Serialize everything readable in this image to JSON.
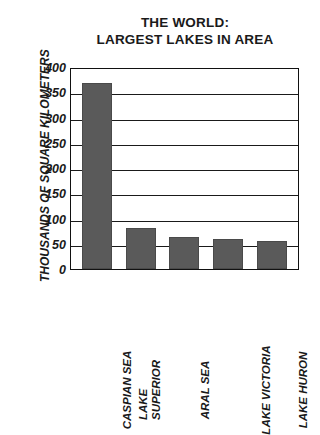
{
  "chart_data": {
    "type": "bar",
    "title": "THE WORLD: LARGEST LAKES IN AREA",
    "title_lines": [
      "THE WORLD:",
      "LARGEST LAKES IN AREA"
    ],
    "xlabel": "",
    "ylabel": "THOUSANDS OF SQUARE KILOMETERS",
    "ylim": [
      0,
      400
    ],
    "ytick_step": 50,
    "yticks": [
      400,
      350,
      300,
      250,
      200,
      150,
      100,
      50,
      0
    ],
    "ytick_labels": [
      "400",
      "350",
      "300",
      "250",
      "200",
      "150",
      "100",
      "50",
      "0"
    ],
    "grid": true,
    "grid_axis": "y",
    "legend": false,
    "categories": [
      "CASPIAN SEA",
      "LAKE SUPERIOR",
      "ARAL SEA",
      "LAKE VICTORIA",
      "LAKE HURON"
    ],
    "category_label_lines": [
      [
        "CASPIAN SEA"
      ],
      [
        "LAKE",
        "SUPERIOR"
      ],
      [
        "ARAL SEA"
      ],
      [
        "LAKE VICTORIA"
      ],
      [
        "LAKE HURON"
      ]
    ],
    "values": [
      374,
      82,
      64,
      61,
      57
    ],
    "bar_color": "#5a5a5a",
    "axis_color": "#1a1a1a",
    "background_color": "#ffffff"
  }
}
